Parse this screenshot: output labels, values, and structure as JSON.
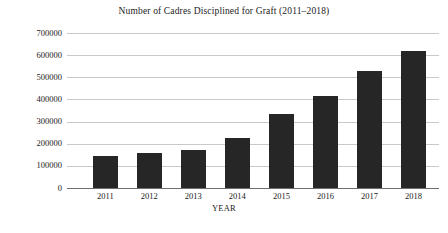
{
  "chart_data": {
    "type": "bar",
    "title": "Number of Cadres Disciplined for Graft (2011–2018)",
    "xlabel": "YEAR",
    "ylabel": "",
    "categories": [
      "2011",
      "2012",
      "2013",
      "2014",
      "2015",
      "2016",
      "2017",
      "2018"
    ],
    "values": [
      144000,
      158000,
      172000,
      225000,
      335000,
      415000,
      527000,
      621000
    ],
    "ylim": [
      0,
      700000
    ],
    "y_ticks": [
      0,
      100000,
      200000,
      300000,
      400000,
      500000,
      600000,
      700000
    ],
    "y_tick_labels": [
      "0",
      "100000",
      "200000",
      "300000",
      "400000",
      "500000",
      "600000",
      "700000"
    ],
    "grid": true,
    "legend": null,
    "series": [
      {
        "name": "Cadres disciplined",
        "color": "#262626",
        "values": [
          144000,
          158000,
          172000,
          225000,
          335000,
          415000,
          527000,
          621000
        ]
      }
    ]
  }
}
